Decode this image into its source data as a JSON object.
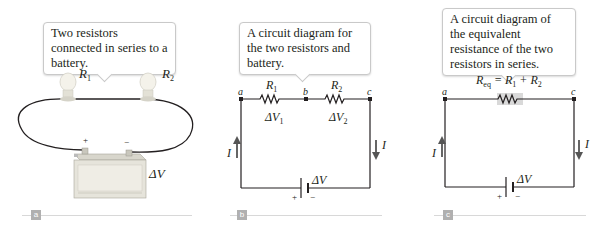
{
  "panels": [
    {
      "id": "a",
      "tag": "a",
      "caption": "Two resistors connected in series to a battery.",
      "labels": {
        "r1": "R",
        "r1_sub": "1",
        "r2": "R",
        "r2_sub": "2",
        "battery": "ΔV",
        "plus": "+",
        "minus": "−"
      }
    },
    {
      "id": "b",
      "tag": "b",
      "caption": "A circuit diagram for the two resistors and battery.",
      "labels": {
        "node_a": "a",
        "node_b": "b",
        "node_c": "c",
        "r1": "R",
        "r1_sub": "1",
        "r2": "R",
        "r2_sub": "2",
        "dv1": "ΔV",
        "dv1_sub": "1",
        "dv2": "ΔV",
        "dv2_sub": "2",
        "current_left": "I",
        "current_right": "I",
        "battery": "ΔV",
        "plus": "+",
        "minus": "−"
      }
    },
    {
      "id": "c",
      "tag": "c",
      "caption": "A circuit diagram of the equivalent resistance of the two resistors in series.",
      "labels": {
        "node_a": "a",
        "node_c": "c",
        "req": "R",
        "req_sub": "eq",
        "eq_rest": " = R",
        "r1_sub": "1",
        "plus_r": " + R",
        "r2_sub": "2",
        "current_left": "I",
        "current_right": "I",
        "battery": "ΔV",
        "plus": "+",
        "minus": "−"
      }
    }
  ],
  "colors": {
    "wire": "#231f20",
    "callout_border": "#c9c9c9",
    "tag_bg": "#b0b0b0",
    "resistor_highlight": "#d9d9d9",
    "arrow": "#555555"
  }
}
